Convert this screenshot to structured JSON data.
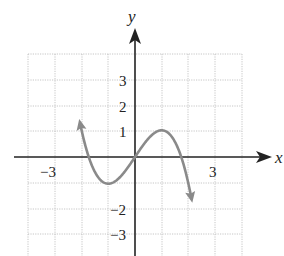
{
  "chart_data": {
    "type": "line",
    "title": "",
    "xlabel": "x",
    "ylabel": "y",
    "xlim": [
      -4,
      4
    ],
    "ylim": [
      -4,
      4
    ],
    "grid": true,
    "x_ticks_labeled": [
      -3,
      3
    ],
    "y_ticks_labeled": [
      3,
      2,
      1,
      -2,
      -3
    ],
    "tick_labels": {
      "x_neg": "−3",
      "x_pos": "3",
      "y3": "3",
      "y2": "2",
      "y1": "1",
      "yn2": "−2",
      "yn3": "−3"
    },
    "series": [
      {
        "name": "f(x)",
        "description": "cubic with negative leading coefficient; local min near (-1,-1), local max near (1,1), passes through origin",
        "color": "#8a8a8a",
        "x": [
          -2.0,
          -1.73,
          -1.0,
          0.0,
          1.0,
          1.73,
          2.0
        ],
        "y": [
          2.0,
          0.0,
          -1.0,
          0.0,
          1.0,
          0.0,
          -2.0
        ],
        "arrows": "both ends"
      }
    ]
  },
  "axes": {
    "x_label": "x",
    "y_label": "y"
  }
}
